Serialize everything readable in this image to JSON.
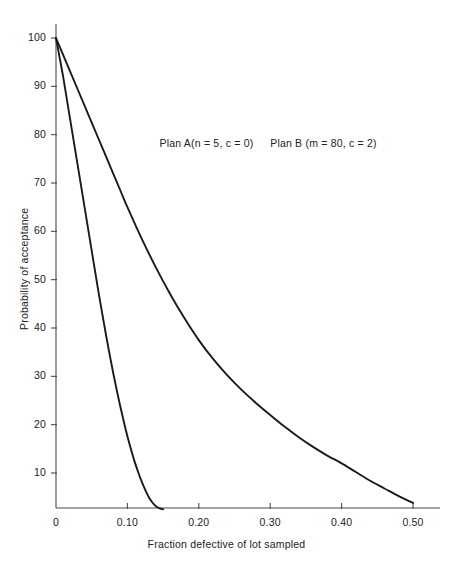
{
  "chart_data": {
    "type": "line",
    "title": "",
    "xlabel": "Fraction defective of lot sampled",
    "ylabel": "Probability of acceptance",
    "xlim": [
      0,
      0.53
    ],
    "ylim": [
      0,
      104
    ],
    "grid": false,
    "legend_position": "inside-top",
    "xticks": [
      {
        "value": 0,
        "label": "0"
      },
      {
        "value": 0.1,
        "label": "0.10"
      },
      {
        "value": 0.2,
        "label": "0.20"
      },
      {
        "value": 0.3,
        "label": "0.30"
      },
      {
        "value": 0.4,
        "label": "0.40"
      },
      {
        "value": 0.5,
        "label": "0.50"
      }
    ],
    "yticks": [
      {
        "value": 10,
        "label": "10"
      },
      {
        "value": 20,
        "label": "20"
      },
      {
        "value": 30,
        "label": "30"
      },
      {
        "value": 40,
        "label": "40"
      },
      {
        "value": 50,
        "label": "50"
      },
      {
        "value": 60,
        "label": "60"
      },
      {
        "value": 70,
        "label": "70"
      },
      {
        "value": 80,
        "label": "80"
      },
      {
        "value": 90,
        "label": "90"
      },
      {
        "value": 100,
        "label": "100"
      }
    ],
    "series": [
      {
        "name": "Plan A",
        "annotation": "Plan A(n = 5, c = 0)",
        "color": "#1a1a1a",
        "x": [
          0.0,
          0.005,
          0.01,
          0.015,
          0.02,
          0.025,
          0.03,
          0.035,
          0.04,
          0.045,
          0.05,
          0.055,
          0.06,
          0.065,
          0.07,
          0.075,
          0.08,
          0.085,
          0.09,
          0.095,
          0.1,
          0.105,
          0.11,
          0.115,
          0.12,
          0.125,
          0.13,
          0.135,
          0.14,
          0.145,
          0.15
        ],
        "y": [
          100.0,
          96.0,
          92.0,
          87.5,
          83.0,
          78.5,
          74.0,
          69.5,
          65.0,
          60.5,
          56.0,
          51.5,
          47.0,
          42.8,
          38.6,
          34.6,
          30.8,
          27.2,
          23.8,
          20.6,
          17.6,
          14.9,
          12.4,
          10.2,
          8.2,
          6.5,
          5.0,
          3.9,
          3.1,
          2.7,
          2.5
        ]
      },
      {
        "name": "Plan B",
        "annotation": "Plan B (m = 80, c = 2)",
        "color": "#1a1a1a",
        "x": [
          0.0,
          0.01,
          0.02,
          0.03,
          0.04,
          0.05,
          0.06,
          0.07,
          0.08,
          0.09,
          0.1,
          0.12,
          0.14,
          0.16,
          0.18,
          0.2,
          0.22,
          0.24,
          0.26,
          0.28,
          0.3,
          0.32,
          0.34,
          0.36,
          0.38,
          0.4,
          0.42,
          0.44,
          0.46,
          0.48,
          0.5
        ],
        "y": [
          100.0,
          96.5,
          93.0,
          89.5,
          86.0,
          82.5,
          79.0,
          75.5,
          72.0,
          68.5,
          65.0,
          58.5,
          52.5,
          47.0,
          42.0,
          37.5,
          33.6,
          30.2,
          27.2,
          24.5,
          22.0,
          19.6,
          17.4,
          15.4,
          13.6,
          12.0,
          10.2,
          8.4,
          6.8,
          5.2,
          3.8
        ]
      }
    ],
    "annotations": [
      {
        "text": "Plan A(n = 5, c = 0)",
        "x": 0.145,
        "y": 78
      },
      {
        "text": "Plan B (m = 80, c = 2)",
        "x": 0.3,
        "y": 78
      }
    ]
  }
}
